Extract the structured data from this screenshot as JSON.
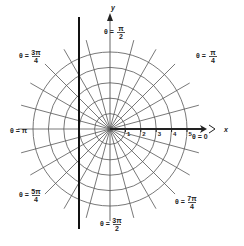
{
  "diagram": {
    "type": "polar-grid",
    "origin": {
      "x": 110,
      "y": 129
    },
    "unit_px": 15.4,
    "circles": [
      1,
      2,
      3,
      4,
      5
    ],
    "radial_step_deg": 15,
    "radial_length_px": 92,
    "colors": {
      "grid": "#555555",
      "axis": "#222222",
      "thick_line": "#111111",
      "background": "#ffffff"
    },
    "axes": {
      "x_label": "x",
      "y_label": "y",
      "x_ticks": [
        "1",
        "2",
        "3",
        "4",
        "5"
      ]
    },
    "thick_line": {
      "x": 79,
      "y1": 17,
      "y2": 229
    },
    "angle_labels": [
      {
        "id": "theta-0",
        "text": "θ = 0",
        "x": 192,
        "y": 139
      },
      {
        "id": "theta-pi-4",
        "text": "θ = π/4",
        "prefix": "θ =",
        "num": "π",
        "den": "4",
        "x": 196,
        "y": 58
      },
      {
        "id": "theta-pi-2",
        "text": "θ = π/2",
        "prefix": "θ =",
        "num": "π",
        "den": "2",
        "x": 104,
        "y": 34
      },
      {
        "id": "theta-3pi-4",
        "text": "θ = 3π/4",
        "prefix": "θ =",
        "num": "3π",
        "den": "4",
        "x": 19,
        "y": 58
      },
      {
        "id": "theta-pi",
        "text": "θ = π",
        "x": 10,
        "y": 133
      },
      {
        "id": "theta-5pi-4",
        "text": "θ = 5π/4",
        "prefix": "θ =",
        "num": "5π",
        "den": "4",
        "x": 19,
        "y": 197
      },
      {
        "id": "theta-3pi-2",
        "text": "θ = 3π/2",
        "prefix": "θ =",
        "num": "3π",
        "den": "2",
        "x": 100,
        "y": 226
      },
      {
        "id": "theta-7pi-4",
        "text": "θ = 7π/4",
        "prefix": "θ =",
        "num": "7π",
        "den": "4",
        "x": 175,
        "y": 204
      }
    ]
  }
}
